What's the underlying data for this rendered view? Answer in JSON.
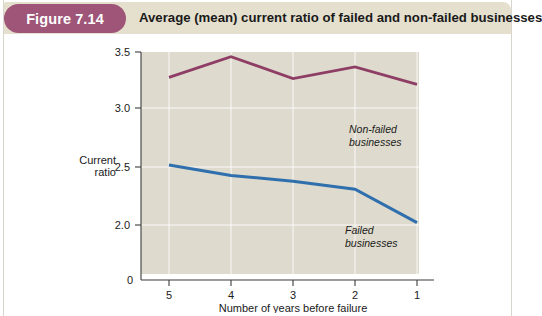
{
  "header": {
    "badge_label": "Figure 7.14",
    "title": "Average (mean) current ratio of failed and non-failed businesses",
    "badge_color": "#9e5578",
    "bar_color": "#e5e0ce"
  },
  "chart_data": {
    "type": "line",
    "title": "Average (mean) current ratio of failed and non-failed businesses",
    "xlabel": "Number of years before failure",
    "ylabel": "Current ratio",
    "categories": [
      "5",
      "4",
      "3",
      "2",
      "1"
    ],
    "x": [
      5,
      4,
      3,
      2,
      1
    ],
    "ylim": [
      1.75,
      3.5
    ],
    "yticks": [
      "0",
      "2.0",
      "2.5",
      "3.0",
      "3.5"
    ],
    "ytick_values": [
      0,
      2.0,
      2.5,
      3.0,
      3.5
    ],
    "axis_break": true,
    "grid": true,
    "legend_position": "inline-annotation",
    "plot_bg_color": "#dedacd",
    "series": [
      {
        "name": "Non-failed businesses",
        "annotation": [
          "Non-failed",
          "businesses"
        ],
        "color": "#8e3d64",
        "values": [
          3.28,
          3.46,
          3.27,
          3.37,
          3.22
        ]
      },
      {
        "name": "Failed businesses",
        "annotation": [
          "Failed",
          "businesses"
        ],
        "color": "#2f6fad",
        "values": [
          2.52,
          2.43,
          2.38,
          2.31,
          2.02
        ]
      }
    ]
  },
  "axis": {
    "y_label_line1": "Current",
    "y_label_line2": "ratio",
    "x_label": "Number of years before failure",
    "zero_label": "0",
    "ticks": [
      {
        "label": "3.5",
        "value": 3.5
      },
      {
        "label": "3.0",
        "value": 3.0
      },
      {
        "label": "2.5",
        "value": 2.5
      },
      {
        "label": "2.0",
        "value": 2.0
      }
    ],
    "xticks": [
      {
        "label": "5",
        "value": 5
      },
      {
        "label": "4",
        "value": 4
      },
      {
        "label": "3",
        "value": 3
      },
      {
        "label": "2",
        "value": 2
      },
      {
        "label": "1",
        "value": 1
      }
    ]
  }
}
